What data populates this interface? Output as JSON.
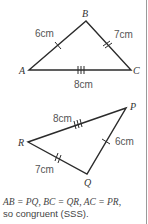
{
  "triangle_abc": {
    "vertices": {
      "A": "A",
      "B": "B",
      "C": "C"
    },
    "sides": [
      {
        "name": "AB",
        "length": "6cm",
        "ticks": 1
      },
      {
        "name": "BC",
        "length": "7cm",
        "ticks": 2
      },
      {
        "name": "AC",
        "length": "8cm",
        "ticks": 3
      }
    ]
  },
  "triangle_pqr": {
    "vertices": {
      "P": "P",
      "Q": "Q",
      "R": "R"
    },
    "sides": [
      {
        "name": "PR",
        "length": "8cm",
        "ticks": 3
      },
      {
        "name": "PQ",
        "length": "6cm",
        "ticks": 1
      },
      {
        "name": "QR",
        "length": "7cm",
        "ticks": 2
      }
    ]
  },
  "caption": {
    "line1": "AB = PQ, BC = QR, AC = PR,",
    "line2": "so congruent (SSS)."
  }
}
